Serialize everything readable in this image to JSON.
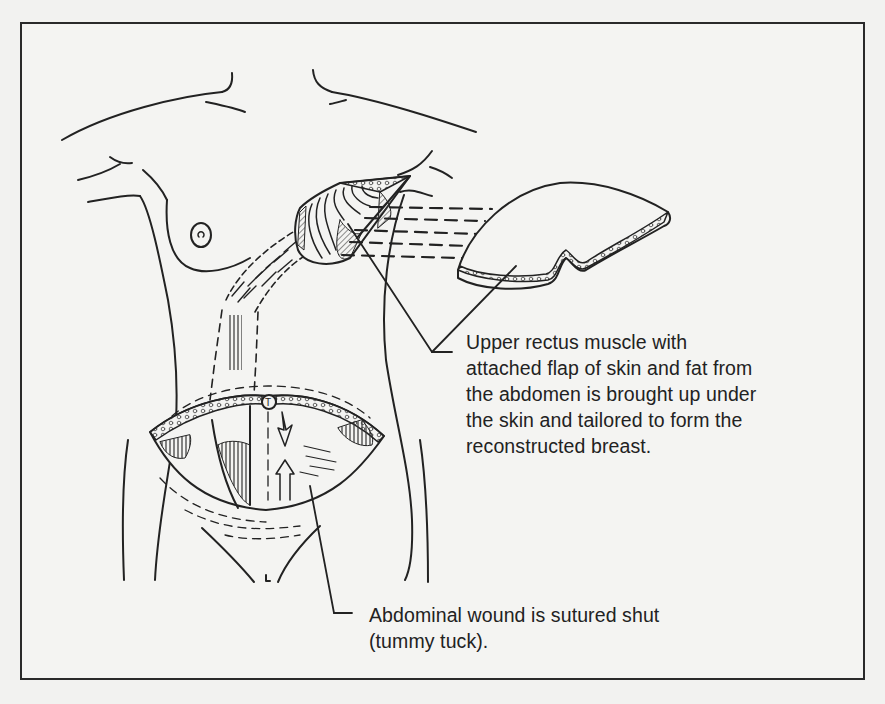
{
  "figure": {
    "type": "medical-illustration",
    "colors": {
      "ink": "#222222",
      "paper": "#f4f4f2",
      "hatch": "#555555"
    }
  },
  "callouts": {
    "upper_rectus": {
      "lines": [
        "Upper rectus muscle with",
        "attached flap of skin and fat from",
        "the abdomen is brought up under",
        "the skin and tailored to form the",
        "reconstructed breast."
      ]
    },
    "abdominal_wound": {
      "lines": [
        "Abdominal wound is sutured shut",
        "(tummy tuck)."
      ]
    }
  }
}
